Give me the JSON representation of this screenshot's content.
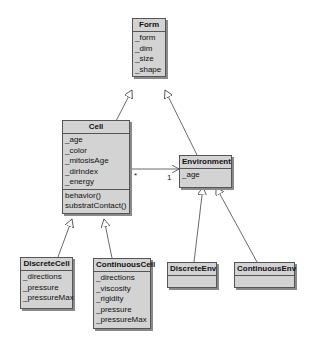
{
  "classes": {
    "form": {
      "name": "Form",
      "attributes": [
        "_form",
        "_dim",
        "_size",
        "_shape"
      ],
      "methods": []
    },
    "cell": {
      "name": "Cell",
      "attributes": [
        "_age",
        "_color",
        "_mitosisAge",
        "_dirIndex",
        "_energy"
      ],
      "methods": [
        "behavior()",
        "substratContact()"
      ]
    },
    "environment": {
      "name": "Environment",
      "attributes": [
        "_age"
      ],
      "methods": []
    },
    "discrete_cell": {
      "name": "DiscreteCell",
      "attributes": [
        "_directions",
        "_pressure",
        "_pressureMax"
      ],
      "methods": []
    },
    "continuous_cell": {
      "name": "ContinuousCell",
      "attributes": [
        "_directions",
        "_viscosity",
        "_rigidity",
        "_pressure",
        "_pressureMax"
      ],
      "methods": []
    },
    "discrete_env": {
      "name": "DiscreteEnv",
      "attributes": [],
      "methods": []
    },
    "continuous_env": {
      "name": "ContinuousEnv",
      "attributes": [],
      "methods": []
    }
  },
  "association": {
    "from": "Cell",
    "to": "Environment",
    "from_multiplicity": "*",
    "to_multiplicity": "1"
  },
  "generalizations": [
    {
      "child": "Cell",
      "parent": "Form"
    },
    {
      "child": "Environment",
      "parent": "Form"
    },
    {
      "child": "DiscreteCell",
      "parent": "Cell"
    },
    {
      "child": "ContinuousCell",
      "parent": "Cell"
    },
    {
      "child": "DiscreteEnv",
      "parent": "Environment"
    },
    {
      "child": "ContinuousEnv",
      "parent": "Environment"
    }
  ]
}
